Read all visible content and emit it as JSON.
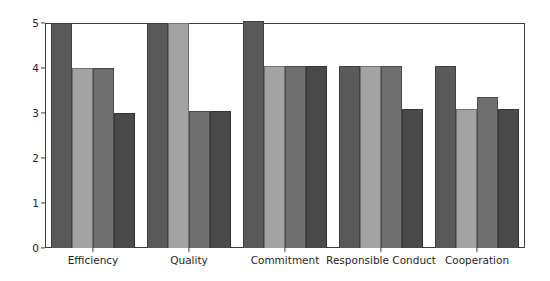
{
  "chart_data": {
    "type": "bar",
    "title": "",
    "xlabel": "",
    "ylabel": "",
    "grid": false,
    "legend_position": "none",
    "ylim": [
      0,
      5
    ],
    "yticks": [
      0,
      1,
      2,
      3,
      4,
      5
    ],
    "ytick_labels": [
      "0",
      "1",
      "2",
      "3",
      "4",
      "5"
    ],
    "categories": [
      "Efficiency",
      "Quality",
      "Commitment",
      "Responsible Conduct",
      "Cooperation"
    ],
    "series": [
      {
        "name": "Series 1",
        "color": "#5a5a5a",
        "values": [
          5.0,
          5.0,
          5.05,
          4.05,
          4.05
        ]
      },
      {
        "name": "Series 2",
        "color": "#a3a3a3",
        "values": [
          4.0,
          5.0,
          4.05,
          4.05,
          3.08
        ]
      },
      {
        "name": "Series 3",
        "color": "#6e6e6e",
        "values": [
          4.0,
          3.05,
          4.05,
          4.05,
          3.35
        ]
      },
      {
        "name": "Series 4",
        "color": "#4a4a4a",
        "values": [
          3.0,
          3.05,
          4.05,
          3.08,
          3.08
        ]
      }
    ]
  },
  "axes": {
    "frame_color": "#3d3d3d",
    "tick_color": "#3d3d3d",
    "label_color": "#1f1f1f"
  }
}
